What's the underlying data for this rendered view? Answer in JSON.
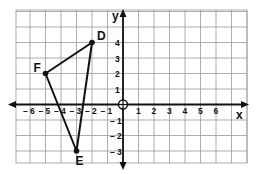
{
  "diagram": {
    "type": "coordinate-plane",
    "x_axis_label": "x",
    "y_axis_label": "y",
    "x_ticks": [
      "-6",
      "-5",
      "-4",
      "-3",
      "-2",
      "-1",
      "1",
      "2",
      "3",
      "4",
      "5",
      "6"
    ],
    "y_ticks": [
      "4",
      "3",
      "2",
      "1",
      "-1",
      "-2",
      "-3"
    ],
    "x_range": [
      -7,
      8
    ],
    "y_range": [
      -4,
      6
    ],
    "points": [
      {
        "label": "D",
        "x": -2,
        "y": 4
      },
      {
        "label": "F",
        "x": -5,
        "y": 2
      },
      {
        "label": "E",
        "x": -3,
        "y": -3
      }
    ],
    "segments": [
      [
        "F",
        "D"
      ],
      [
        "D",
        "E"
      ],
      [
        "E",
        "F"
      ]
    ],
    "colors": {
      "ink": "#111111",
      "grid": "#9a9a9a",
      "background": "#ffffff"
    }
  }
}
